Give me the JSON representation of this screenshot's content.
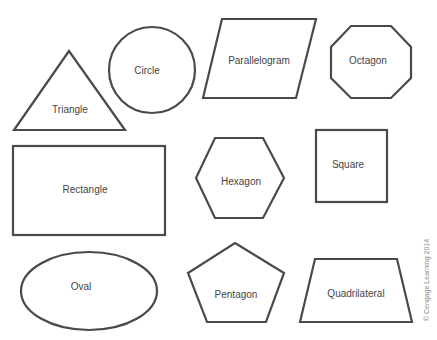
{
  "diagram": {
    "stroke_color": "#4a4a4a",
    "label_color": "#444444",
    "background": "#ffffff",
    "shapes": [
      {
        "name": "triangle",
        "label": "Triangle"
      },
      {
        "name": "circle",
        "label": "Circle"
      },
      {
        "name": "parallelogram",
        "label": "Parallelogram"
      },
      {
        "name": "octagon",
        "label": "Octagon"
      },
      {
        "name": "rectangle",
        "label": "Rectangle"
      },
      {
        "name": "hexagon",
        "label": "Hexagon"
      },
      {
        "name": "square",
        "label": "Square"
      },
      {
        "name": "oval",
        "label": "Oval"
      },
      {
        "name": "pentagon",
        "label": "Pentagon"
      },
      {
        "name": "quadrilateral",
        "label": "Quadrilateral"
      }
    ],
    "credit": "© Cengage Learning 2014"
  }
}
